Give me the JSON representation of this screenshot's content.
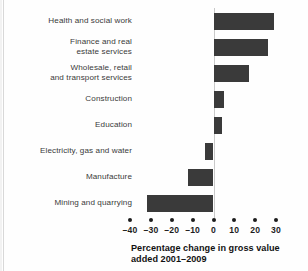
{
  "chart_data": {
    "type": "bar",
    "orientation": "horizontal",
    "title": "",
    "caption_line1": "Percentage change in gross value",
    "caption_line2": "added 2001–2009",
    "xlabel": "Percentage change in gross value added 2001–2009",
    "ylabel": "",
    "xlim": [
      -40,
      30
    ],
    "xticks": [
      -40,
      -30,
      -20,
      -10,
      0,
      10,
      20,
      30
    ],
    "xtick_labels": [
      "–40",
      "–30",
      "–20",
      "–10",
      "0",
      "10",
      "20",
      "30"
    ],
    "grid": false,
    "legend": false,
    "bar_color": "#3a3a3a",
    "categories": [
      "Health and social work",
      "Finance and real estate services",
      "Wholesale, retail and transport services",
      "Construction",
      "Education",
      "Electricity, gas and water",
      "Manufacture",
      "Mining and quarrying"
    ],
    "values": [
      29,
      26,
      17,
      5,
      4,
      -4,
      -12,
      -32
    ]
  },
  "categories_wrapped": [
    [
      "Health and social work"
    ],
    [
      "Finance and real",
      "estate services"
    ],
    [
      "Wholesale, retail",
      "and transport services"
    ],
    [
      "Construction"
    ],
    [
      "Education"
    ],
    [
      "Electricity, gas and water"
    ],
    [
      "Manufacture"
    ],
    [
      "Mining and quarrying"
    ]
  ]
}
